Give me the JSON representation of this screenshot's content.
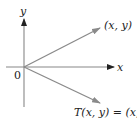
{
  "diagram": {
    "type": "linear-transformation-reflection",
    "axes": {
      "x_label": "x",
      "y_label": "y",
      "origin_label": "0"
    },
    "vectors": [
      {
        "name": "original",
        "label": "(x, y)"
      },
      {
        "name": "image",
        "label": "T(x, y) = (x, −"
      }
    ],
    "colors": {
      "axis": "#888888",
      "vector": "#8a8a8a",
      "arrowhead_axis": "#222222",
      "text": "#222222"
    }
  }
}
